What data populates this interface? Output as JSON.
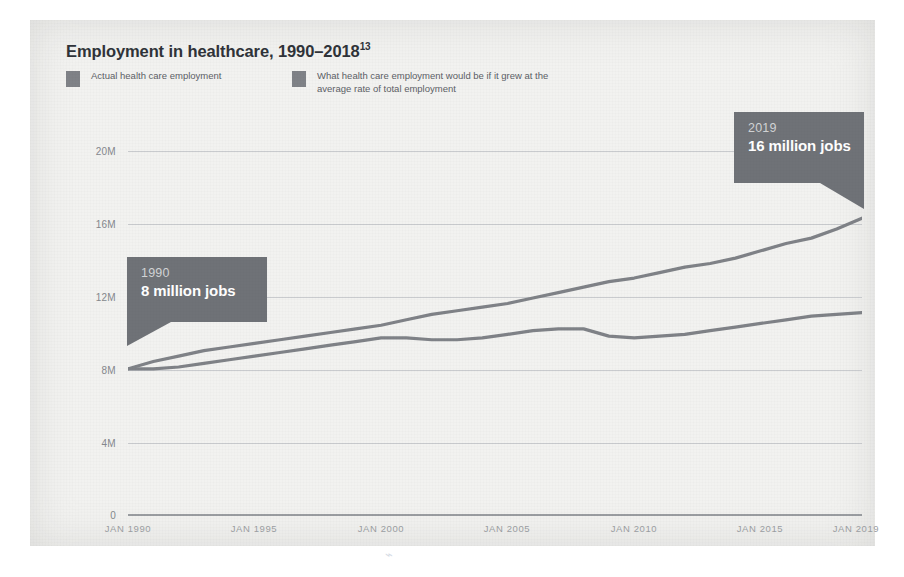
{
  "chart_data": {
    "type": "line",
    "title": "Employment in healthcare, 1990–2018",
    "title_superscript": "13",
    "xlabel": "",
    "ylabel": "",
    "ylim": [
      0,
      20000000
    ],
    "yticks": [
      "0",
      "4M",
      "8M",
      "12M",
      "16M",
      "20M"
    ],
    "ytick_values": [
      0,
      4000000,
      8000000,
      12000000,
      16000000,
      20000000
    ],
    "xticks": [
      "JAN 1990",
      "JAN 1995",
      "JAN 2000",
      "JAN 2005",
      "JAN 2010",
      "JAN 2015",
      "JAN 2019"
    ],
    "xtick_values": [
      1990,
      1995,
      2000,
      2005,
      2010,
      2015,
      2019
    ],
    "xlim": [
      1990,
      2019
    ],
    "grid": true,
    "legend_position": "top-left",
    "series": [
      {
        "name": "Actual health care employment",
        "color": "#7f8287",
        "x": [
          1990,
          1991,
          1992,
          1993,
          1994,
          1995,
          1996,
          1997,
          1998,
          1999,
          2000,
          2001,
          2002,
          2003,
          2004,
          2005,
          2006,
          2007,
          2008,
          2009,
          2010,
          2011,
          2012,
          2013,
          2014,
          2015,
          2016,
          2017,
          2018,
          2019
        ],
        "values": [
          8.0,
          8.4,
          8.7,
          9.0,
          9.2,
          9.4,
          9.6,
          9.8,
          10.0,
          10.2,
          10.4,
          10.7,
          11.0,
          11.2,
          11.4,
          11.6,
          11.9,
          12.2,
          12.5,
          12.8,
          13.0,
          13.3,
          13.6,
          13.8,
          14.1,
          14.5,
          14.9,
          15.2,
          15.7,
          16.3
        ],
        "unit": "millions of jobs"
      },
      {
        "name": "What health care employment would be if it grew at the average rate of total employment",
        "color": "#7f8287",
        "x": [
          1990,
          1991,
          1992,
          1993,
          1994,
          1995,
          1996,
          1997,
          1998,
          1999,
          2000,
          2001,
          2002,
          2003,
          2004,
          2005,
          2006,
          2007,
          2008,
          2009,
          2010,
          2011,
          2012,
          2013,
          2014,
          2015,
          2016,
          2017,
          2018,
          2019
        ],
        "values": [
          8.0,
          8.0,
          8.1,
          8.3,
          8.5,
          8.7,
          8.9,
          9.1,
          9.3,
          9.5,
          9.7,
          9.7,
          9.6,
          9.6,
          9.7,
          9.9,
          10.1,
          10.2,
          10.2,
          9.8,
          9.7,
          9.8,
          9.9,
          10.1,
          10.3,
          10.5,
          10.7,
          10.9,
          11.0,
          11.1
        ],
        "unit": "millions of jobs"
      }
    ],
    "annotations": [
      {
        "id": "1990",
        "year_label": "1990",
        "value_label": "8 million jobs",
        "x": 1990,
        "y": 8000000
      },
      {
        "id": "2019",
        "year_label": "2019",
        "value_label": "16 million jobs",
        "x": 2019,
        "y": 16000000
      }
    ]
  },
  "legend": {
    "actual": "Actual health care employment",
    "counterfactual": "What health care employment would be if it grew at the average rate of total employment"
  },
  "colors": {
    "series": "#7f8287",
    "callout_bg": "#6f7277",
    "grid": "#c9cbce",
    "axis": "#9a9da1",
    "panel_bg": "#f2f2f0",
    "title_text": "#2f3339",
    "tick_text": "#9b9ea2"
  },
  "artifact": {
    "mark": "⌁"
  }
}
